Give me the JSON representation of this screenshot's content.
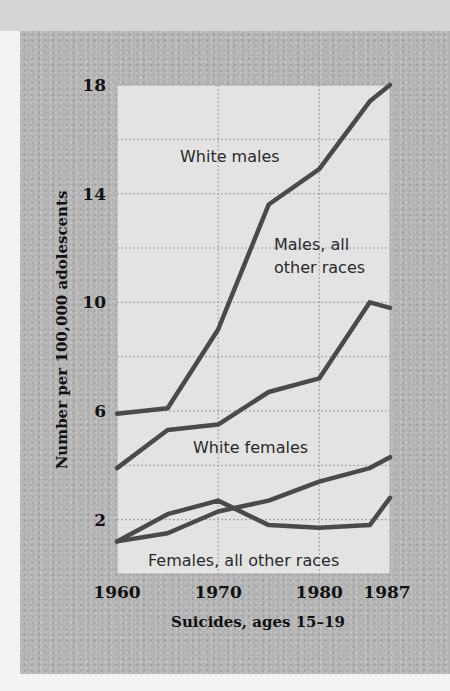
{
  "chart_data": {
    "type": "line",
    "title": "",
    "xlabel": "Suicides, ages 15–19",
    "ylabel": "Number per 100,000 adolescents",
    "x": [
      1960,
      1965,
      1970,
      1975,
      1980,
      1985,
      1987
    ],
    "x_ticks": [
      "1960",
      "1970",
      "1980",
      "1987"
    ],
    "x_tick_values": [
      1960,
      1970,
      1980,
      1987
    ],
    "y_ticks": [
      "2",
      "6",
      "10",
      "14",
      "18"
    ],
    "y_tick_values": [
      2,
      6,
      10,
      14,
      18
    ],
    "xlim": [
      1960,
      1987
    ],
    "ylim": [
      0,
      18
    ],
    "grid": true,
    "legend": "inline labels",
    "series": [
      {
        "name": "White males",
        "values": [
          5.9,
          6.1,
          9.0,
          13.6,
          14.9,
          17.4,
          18.0
        ]
      },
      {
        "name": "Males, all other races",
        "values": [
          3.9,
          5.3,
          5.5,
          6.7,
          7.2,
          10.0,
          9.8
        ]
      },
      {
        "name": "White females",
        "values": [
          1.2,
          1.5,
          2.3,
          2.7,
          3.4,
          3.9,
          4.3
        ]
      },
      {
        "name": "Females, all other races",
        "values": [
          1.2,
          2.2,
          2.7,
          1.8,
          1.7,
          1.8,
          2.8
        ]
      }
    ],
    "labels": {
      "white_males": "White males",
      "males_other_line1": "Males, all",
      "males_other_line2": "other races",
      "white_females": "White females",
      "females_other": "Females, all other races"
    },
    "colors": {
      "line": "#4a4a4a",
      "plot_bg": "#e3e3e3",
      "grid": "#9a9a9a",
      "panel_bg": "#b4b4b4"
    }
  }
}
